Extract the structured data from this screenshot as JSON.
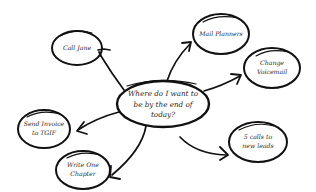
{
  "diagram": {
    "type": "mind-map",
    "style": "hand-drawn",
    "ink_color": "#111111",
    "background": "#ffffff",
    "center": {
      "lines": [
        "Where do I want to",
        "be by the end of",
        "today?"
      ]
    },
    "nodes": [
      {
        "id": "call-jane",
        "lines": [
          "Call Jane"
        ]
      },
      {
        "id": "mail-planners",
        "lines": [
          "Mail Planners"
        ]
      },
      {
        "id": "change-voicemail",
        "lines": [
          "Change",
          "Voicemail"
        ]
      },
      {
        "id": "send-invoice",
        "lines": [
          "Send Invoice",
          "to TGIF"
        ]
      },
      {
        "id": "write-chapter",
        "lines": [
          "Write One",
          "Chapter"
        ]
      },
      {
        "id": "calls-new-leads",
        "lines": [
          "5 calls to",
          "new leads"
        ]
      }
    ],
    "edges": [
      {
        "from": "center",
        "to": "call-jane",
        "arrow": "toward-node"
      },
      {
        "from": "center",
        "to": "mail-planners",
        "arrow": "toward-node"
      },
      {
        "from": "center",
        "to": "change-voicemail",
        "arrow": "toward-node"
      },
      {
        "from": "center",
        "to": "send-invoice",
        "arrow": "toward-node"
      },
      {
        "from": "center",
        "to": "write-chapter",
        "arrow": "toward-node"
      },
      {
        "from": "center",
        "to": "calls-new-leads",
        "arrow": "toward-node"
      }
    ]
  }
}
